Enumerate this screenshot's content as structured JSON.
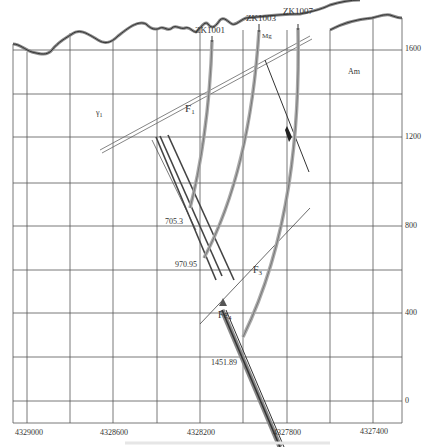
{
  "figure": {
    "type": "geological cross-section",
    "x_axis_ticks": [
      "4329000",
      "4328600",
      "4328200",
      "4327800",
      "4327400"
    ],
    "y_axis_ticks": [
      "1600",
      "1200",
      "800",
      "400",
      "0"
    ],
    "boreholes": [
      {
        "name": "ZK1001",
        "depth_label": "705.3"
      },
      {
        "name": "ZK1003",
        "depth_label": "970.95"
      },
      {
        "name": "ZK1007",
        "depth_label": "1451.89"
      }
    ],
    "faults": [
      "F1",
      "F3"
    ],
    "units": {
      "left": "γ1",
      "right": "Am"
    },
    "markers": {
      "mg": "Mg",
      "fe": "Fe4"
    },
    "caption": ""
  },
  "labels": {
    "zk1001": "ZK1001",
    "zk1003": "ZK1003",
    "zk1007": "ZK1007",
    "f1": "F",
    "f1_sub": "1",
    "f3": "F",
    "f3_sub": "3",
    "gamma": "γ",
    "gamma_sub": "1",
    "am": "Am",
    "mg": "Mg",
    "fe": "Fe",
    "fe_sub": "4",
    "d1": "705.3",
    "d2": "970.95",
    "d3": "1451.89",
    "x0": "4329000",
    "x1": "4328600",
    "x2": "4328200",
    "x3": "4327800",
    "x4": "4327400",
    "y0": "1600",
    "y1": "1200",
    "y2": "800",
    "y3": "400",
    "y4": "0"
  }
}
